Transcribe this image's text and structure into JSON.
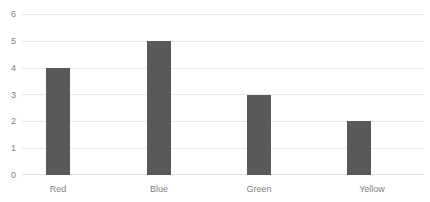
{
  "chart_data": {
    "type": "bar",
    "title": "",
    "xlabel": "",
    "ylabel": "",
    "categories": [
      "Red",
      "Blue",
      "Green",
      "Yellow"
    ],
    "values": [
      4,
      5,
      3,
      2
    ],
    "ylim": [
      0,
      6
    ],
    "yticks": [
      0,
      1,
      2,
      3,
      4,
      5,
      6
    ],
    "ytick_labels": [
      "0",
      "1",
      "2",
      "3",
      "4",
      "5",
      "6"
    ],
    "grid": "horizontal",
    "legend": "none",
    "bar_color": "#595959",
    "gridline_color": "#e9e9e9",
    "label_color": "#808080",
    "background_color": "#ffffff"
  }
}
